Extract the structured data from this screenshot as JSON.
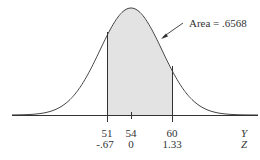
{
  "chart_data": {
    "type": "area",
    "title": "",
    "distribution": {
      "mean": 54,
      "sd": 4.5
    },
    "shaded_region": {
      "from_y": 51,
      "to_y": 60,
      "from_z": -0.67,
      "to_z": 1.33,
      "area": 0.6568
    },
    "annotation": "Area = .6568",
    "x_ticks_y": [
      "51",
      "54",
      "60"
    ],
    "x_ticks_z": [
      "-.67",
      "0",
      "1.33"
    ],
    "axis_labels": {
      "y_row": "Y",
      "z_row": "Z"
    },
    "colors": {
      "shade": "#e3e3e3",
      "curve": "#444444"
    }
  }
}
